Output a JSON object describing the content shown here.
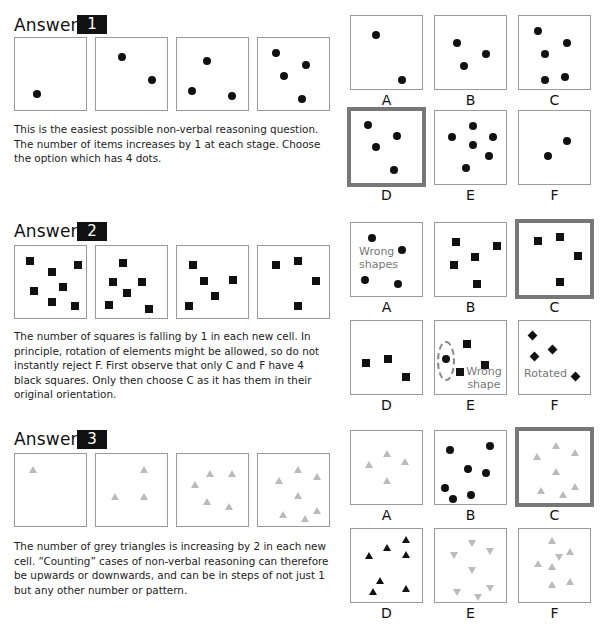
{
  "sections": [
    {
      "heading": "Answer",
      "number": "1",
      "explanation": "This is the easiest possible non-verbal reasoning question. The number of items increases by 1 at each stage. Choose the option which has 4 dots.",
      "sequence": [
        {
          "items": [
            {
              "shape": "dot",
              "x": 22,
              "y": 56
            }
          ]
        },
        {
          "items": [
            {
              "shape": "dot",
              "x": 26,
              "y": 19
            },
            {
              "shape": "dot",
              "x": 56,
              "y": 42
            }
          ]
        },
        {
          "items": [
            {
              "shape": "dot",
              "x": 30,
              "y": 23
            },
            {
              "shape": "dot",
              "x": 15,
              "y": 53
            },
            {
              "shape": "dot",
              "x": 55,
              "y": 58
            }
          ]
        },
        {
          "items": [
            {
              "shape": "dot",
              "x": 18,
              "y": 15
            },
            {
              "shape": "dot",
              "x": 48,
              "y": 27
            },
            {
              "shape": "dot",
              "x": 26,
              "y": 38
            },
            {
              "shape": "dot",
              "x": 44,
              "y": 61
            }
          ]
        }
      ],
      "options": [
        {
          "label": "A",
          "selected": false,
          "items": [
            {
              "shape": "dot",
              "x": 25,
              "y": 19
            },
            {
              "shape": "dot",
              "x": 51,
              "y": 64
            }
          ]
        },
        {
          "label": "B",
          "selected": false,
          "items": [
            {
              "shape": "dot",
              "x": 22,
              "y": 27
            },
            {
              "shape": "dot",
              "x": 51,
              "y": 38
            },
            {
              "shape": "dot",
              "x": 29,
              "y": 50
            }
          ]
        },
        {
          "label": "C",
          "selected": false,
          "items": [
            {
              "shape": "dot",
              "x": 19,
              "y": 15
            },
            {
              "shape": "dot",
              "x": 48,
              "y": 27
            },
            {
              "shape": "dot",
              "x": 26,
              "y": 38
            },
            {
              "shape": "dot",
              "x": 46,
              "y": 61
            },
            {
              "shape": "dot",
              "x": 26,
              "y": 64
            }
          ]
        },
        {
          "label": "D",
          "selected": true,
          "items": [
            {
              "shape": "dot",
              "x": 20,
              "y": 17
            },
            {
              "shape": "dot",
              "x": 49,
              "y": 28
            },
            {
              "shape": "dot",
              "x": 28,
              "y": 39
            },
            {
              "shape": "dot",
              "x": 46,
              "y": 62
            }
          ]
        },
        {
          "label": "E",
          "selected": false,
          "items": [
            {
              "shape": "dot",
              "x": 38,
              "y": 15
            },
            {
              "shape": "dot",
              "x": 17,
              "y": 26
            },
            {
              "shape": "dot",
              "x": 58,
              "y": 26
            },
            {
              "shape": "dot",
              "x": 38,
              "y": 34
            },
            {
              "shape": "dot",
              "x": 54,
              "y": 45
            },
            {
              "shape": "dot",
              "x": 31,
              "y": 57
            }
          ]
        },
        {
          "label": "F",
          "selected": false,
          "items": [
            {
              "shape": "dot",
              "x": 48,
              "y": 30
            },
            {
              "shape": "dot",
              "x": 29,
              "y": 45
            }
          ]
        }
      ]
    },
    {
      "heading": "Answer",
      "number": "2",
      "explanation": "The number of squares is falling by 1 in each new cell. In principle, rotation of elements might be allowed, so do not instantly reject F. First observe that only C and F have 4 black squares. Only then choose C as it has them in their original orientation.",
      "sequence": [
        {
          "items": [
            {
              "shape": "square",
              "x": 15,
              "y": 15
            },
            {
              "shape": "square",
              "x": 37,
              "y": 26
            },
            {
              "shape": "square",
              "x": 63,
              "y": 19
            },
            {
              "shape": "square",
              "x": 19,
              "y": 45
            },
            {
              "shape": "square",
              "x": 48,
              "y": 41
            },
            {
              "shape": "square",
              "x": 37,
              "y": 56
            },
            {
              "shape": "square",
              "x": 60,
              "y": 60
            }
          ]
        },
        {
          "items": [
            {
              "shape": "square",
              "x": 27,
              "y": 17
            },
            {
              "shape": "square",
              "x": 17,
              "y": 36
            },
            {
              "shape": "square",
              "x": 46,
              "y": 36
            },
            {
              "shape": "square",
              "x": 31,
              "y": 47
            },
            {
              "shape": "square",
              "x": 13,
              "y": 59
            },
            {
              "shape": "square",
              "x": 53,
              "y": 63
            }
          ]
        },
        {
          "items": [
            {
              "shape": "square",
              "x": 16,
              "y": 19
            },
            {
              "shape": "square",
              "x": 27,
              "y": 35
            },
            {
              "shape": "square",
              "x": 56,
              "y": 34
            },
            {
              "shape": "square",
              "x": 38,
              "y": 50
            },
            {
              "shape": "square",
              "x": 12,
              "y": 60
            }
          ]
        },
        {
          "items": [
            {
              "shape": "square",
              "x": 18,
              "y": 19
            },
            {
              "shape": "square",
              "x": 40,
              "y": 15
            },
            {
              "shape": "square",
              "x": 58,
              "y": 35
            },
            {
              "shape": "square",
              "x": 40,
              "y": 60
            }
          ]
        }
      ],
      "options": [
        {
          "label": "A",
          "selected": false,
          "note": "Wrong shapes",
          "items": [
            {
              "shape": "dot",
              "x": 21,
              "y": 15
            },
            {
              "shape": "dot",
              "x": 51,
              "y": 27
            },
            {
              "shape": "dot",
              "x": 14,
              "y": 57
            },
            {
              "shape": "dot",
              "x": 47,
              "y": 61
            }
          ]
        },
        {
          "label": "B",
          "selected": false,
          "items": [
            {
              "shape": "square",
              "x": 21,
              "y": 19
            },
            {
              "shape": "square",
              "x": 62,
              "y": 23
            },
            {
              "shape": "square",
              "x": 40,
              "y": 34
            },
            {
              "shape": "square",
              "x": 19,
              "y": 42
            },
            {
              "shape": "square",
              "x": 42,
              "y": 61
            }
          ]
        },
        {
          "label": "C",
          "selected": true,
          "items": [
            {
              "shape": "square",
              "x": 22,
              "y": 21
            },
            {
              "shape": "square",
              "x": 44,
              "y": 17
            },
            {
              "shape": "square",
              "x": 62,
              "y": 36
            },
            {
              "shape": "square",
              "x": 44,
              "y": 62
            }
          ]
        },
        {
          "label": "D",
          "selected": false,
          "items": [
            {
              "shape": "square",
              "x": 15,
              "y": 42
            },
            {
              "shape": "square",
              "x": 37,
              "y": 38
            },
            {
              "shape": "square",
              "x": 55,
              "y": 56
            }
          ]
        },
        {
          "label": "E",
          "selected": false,
          "note": "Wrong shape",
          "ellipse": true,
          "items": [
            {
              "shape": "square",
              "x": 32,
              "y": 23
            },
            {
              "shape": "dot",
              "x": 11,
              "y": 38
            },
            {
              "shape": "square",
              "x": 50,
              "y": 44
            },
            {
              "shape": "square",
              "x": 25,
              "y": 51
            }
          ]
        },
        {
          "label": "F",
          "selected": false,
          "note": "Rotated",
          "items": [
            {
              "shape": "diamond",
              "x": 13,
              "y": 14
            },
            {
              "shape": "diamond",
              "x": 33,
              "y": 28
            },
            {
              "shape": "diamond",
              "x": 15,
              "y": 35
            },
            {
              "shape": "diamond",
              "x": 56,
              "y": 55
            }
          ]
        }
      ]
    },
    {
      "heading": "Answer",
      "number": "3",
      "explanation": "The number of grey triangles is increasing by 2 in each new cell. “Counting” cases of non-verbal reasoning can therefore be upwards or downwards, and can be in steps of not just 1 but any other number or pattern.",
      "sequence": [
        {
          "items": [
            {
              "shape": "tri",
              "x": 18,
              "y": 16
            }
          ]
        },
        {
          "items": [
            {
              "shape": "tri",
              "x": 48,
              "y": 16
            },
            {
              "shape": "tri",
              "x": 19,
              "y": 43
            },
            {
              "shape": "tri",
              "x": 48,
              "y": 43
            }
          ]
        },
        {
          "items": [
            {
              "shape": "tri",
              "x": 33,
              "y": 20
            },
            {
              "shape": "tri",
              "x": 55,
              "y": 20
            },
            {
              "shape": "tri",
              "x": 18,
              "y": 31
            },
            {
              "shape": "tri",
              "x": 30,
              "y": 48
            },
            {
              "shape": "tri",
              "x": 52,
              "y": 53
            }
          ]
        },
        {
          "items": [
            {
              "shape": "tri",
              "x": 40,
              "y": 16
            },
            {
              "shape": "tri",
              "x": 21,
              "y": 27
            },
            {
              "shape": "tri",
              "x": 59,
              "y": 23
            },
            {
              "shape": "tri",
              "x": 40,
              "y": 42
            },
            {
              "shape": "tri",
              "x": 25,
              "y": 61
            },
            {
              "shape": "tri",
              "x": 47,
              "y": 65
            },
            {
              "shape": "tri",
              "x": 59,
              "y": 57
            }
          ]
        }
      ],
      "options": [
        {
          "label": "A",
          "selected": false,
          "items": [
            {
              "shape": "tri",
              "x": 36,
              "y": 23
            },
            {
              "shape": "tri",
              "x": 18,
              "y": 34
            },
            {
              "shape": "tri",
              "x": 54,
              "y": 31
            },
            {
              "shape": "tri",
              "x": 36,
              "y": 50
            }
          ]
        },
        {
          "label": "B",
          "selected": false,
          "items": [
            {
              "shape": "dot",
              "x": 15,
              "y": 19
            },
            {
              "shape": "dot",
              "x": 55,
              "y": 15
            },
            {
              "shape": "dot",
              "x": 33,
              "y": 38
            },
            {
              "shape": "dot",
              "x": 51,
              "y": 42
            },
            {
              "shape": "dot",
              "x": 10,
              "y": 57
            },
            {
              "shape": "dot",
              "x": 18,
              "y": 68
            },
            {
              "shape": "dot",
              "x": 36,
              "y": 64
            }
          ]
        },
        {
          "label": "C",
          "selected": true,
          "items": [
            {
              "shape": "tri",
              "x": 40,
              "y": 18
            },
            {
              "shape": "tri",
              "x": 21,
              "y": 29
            },
            {
              "shape": "tri",
              "x": 59,
              "y": 25
            },
            {
              "shape": "tri",
              "x": 40,
              "y": 44
            },
            {
              "shape": "tri",
              "x": 25,
              "y": 63
            },
            {
              "shape": "tri",
              "x": 47,
              "y": 67
            },
            {
              "shape": "tri",
              "x": 59,
              "y": 59
            }
          ]
        },
        {
          "label": "D",
          "selected": false,
          "items": [
            {
              "shape": "tri-black",
              "x": 55,
              "y": 11
            },
            {
              "shape": "tri-black",
              "x": 36,
              "y": 19
            },
            {
              "shape": "tri-black",
              "x": 18,
              "y": 27
            },
            {
              "shape": "tri-black",
              "x": 55,
              "y": 26
            },
            {
              "shape": "tri-black",
              "x": 29,
              "y": 52
            },
            {
              "shape": "tri-black",
              "x": 22,
              "y": 63
            },
            {
              "shape": "tri-black",
              "x": 55,
              "y": 60
            }
          ]
        },
        {
          "label": "E",
          "selected": false,
          "items": [
            {
              "shape": "tri-down",
              "x": 37,
              "y": 15
            },
            {
              "shape": "tri-down",
              "x": 19,
              "y": 27
            },
            {
              "shape": "tri-down",
              "x": 55,
              "y": 23
            },
            {
              "shape": "tri-down",
              "x": 37,
              "y": 42
            },
            {
              "shape": "tri-down",
              "x": 22,
              "y": 64
            },
            {
              "shape": "tri-down",
              "x": 43,
              "y": 69
            },
            {
              "shape": "tri-down",
              "x": 55,
              "y": 60
            }
          ]
        },
        {
          "label": "F",
          "selected": false,
          "items": [
            {
              "shape": "tri",
              "x": 33,
              "y": 12
            },
            {
              "shape": "tri",
              "x": 51,
              "y": 23
            },
            {
              "shape": "tri-down",
              "x": 40,
              "y": 29
            },
            {
              "shape": "tri",
              "x": 19,
              "y": 35
            },
            {
              "shape": "tri",
              "x": 33,
              "y": 38
            },
            {
              "shape": "tri",
              "x": 33,
              "y": 56
            },
            {
              "shape": "tri",
              "x": 51,
              "y": 53
            }
          ]
        }
      ]
    }
  ]
}
